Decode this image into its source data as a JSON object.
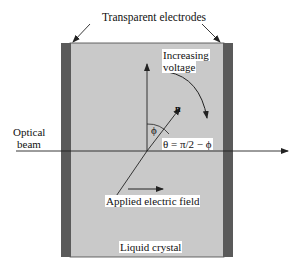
{
  "diagram": {
    "title_label": "Transparent electrodes",
    "increasing_voltage_line1": "Increasing",
    "increasing_voltage_line2": "voltage",
    "director_label": "n",
    "phi_label": "ϕ",
    "theta_label": "θ = π/2 − ϕ",
    "optical_beam_line1": "Optical",
    "optical_beam_line2": "beam",
    "applied_field_label": "Applied electric field",
    "liquid_crystal_label": "Liquid crystal",
    "colors": {
      "cell_fill": "#c9c9c9",
      "electrode_fill": "#5a5a5a",
      "line": "#222222",
      "background": "#ffffff"
    }
  }
}
